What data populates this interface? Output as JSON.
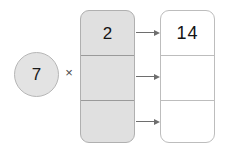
{
  "diagram": {
    "multiplier": {
      "value": "7",
      "shape": "circle",
      "fill_color": "#e3e3e3",
      "border_color": "#b6b6b6"
    },
    "operator": {
      "symbol": "×",
      "name": "multiplication-sign"
    },
    "left_column": {
      "name": "factor-column",
      "fill_color": "#e0e0e0",
      "border_color": "#b0b0b0",
      "cells": [
        {
          "value": "2"
        },
        {
          "value": ""
        },
        {
          "value": ""
        }
      ]
    },
    "right_column": {
      "name": "product-column",
      "fill_color": "#ffffff",
      "border_color": "#bdbdbd",
      "cells": [
        {
          "value": "14"
        },
        {
          "value": ""
        },
        {
          "value": ""
        }
      ]
    },
    "arrows": [
      {
        "name": "arrow-row-1",
        "color": "#6e6e6e"
      },
      {
        "name": "arrow-row-2",
        "color": "#6e6e6e"
      },
      {
        "name": "arrow-row-3",
        "color": "#6e6e6e"
      }
    ]
  }
}
